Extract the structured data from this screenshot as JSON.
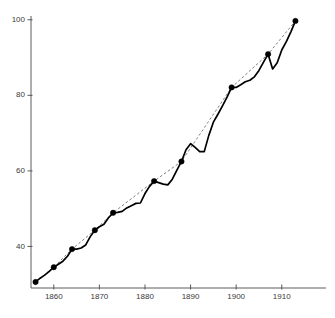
{
  "chart_data": {
    "type": "line",
    "title": "",
    "subtitle": "",
    "xlabel": "",
    "ylabel": "",
    "xlim": [
      1855,
      1914
    ],
    "ylim": [
      29,
      101
    ],
    "grid": false,
    "legend": "none",
    "x_ticks": [
      1860,
      1870,
      1880,
      1890,
      1900,
      1910
    ],
    "x_tick_labels": [
      "1860",
      "1870",
      "1880",
      "1890",
      "1900",
      "1910"
    ],
    "y_ticks": [
      40,
      60,
      80,
      100
    ],
    "y_tick_labels": [
      "40",
      "60",
      "80",
      "100"
    ],
    "series": [
      {
        "name": "annual series",
        "style": "solid",
        "color": "#000000",
        "x": [
          1856,
          1857,
          1858,
          1859,
          1860,
          1861,
          1862,
          1863,
          1864,
          1865,
          1866,
          1867,
          1868,
          1869,
          1870,
          1871,
          1872,
          1873,
          1874,
          1875,
          1876,
          1877,
          1878,
          1879,
          1880,
          1881,
          1882,
          1883,
          1884,
          1885,
          1886,
          1887,
          1888,
          1889,
          1890,
          1891,
          1892,
          1893,
          1894,
          1895,
          1896,
          1897,
          1898,
          1899,
          1900,
          1901,
          1902,
          1903,
          1904,
          1905,
          1906,
          1907,
          1908,
          1909,
          1910,
          1911,
          1912,
          1913
        ],
        "values": [
          30.6,
          31.6,
          32.4,
          33.4,
          34.5,
          35.3,
          36.1,
          37.4,
          39.3,
          39.3,
          39.6,
          40.4,
          42.6,
          44.3,
          45.2,
          45.9,
          47.6,
          48.9,
          49.0,
          49.3,
          50.2,
          50.8,
          51.4,
          51.5,
          54.0,
          55.9,
          57.3,
          56.9,
          56.5,
          56.3,
          57.8,
          60.2,
          62.5,
          65.6,
          67.2,
          66.2,
          65.1,
          65.1,
          69.4,
          72.9,
          75.0,
          77.2,
          79.5,
          82.1,
          82.1,
          82.8,
          83.6,
          84.0,
          84.9,
          86.6,
          88.8,
          90.9,
          87.0,
          88.6,
          92.0,
          94.2,
          96.8,
          99.7
        ]
      },
      {
        "name": "peak-to-peak trend",
        "style": "dashed",
        "color": "#5e5e5e",
        "x": [
          1856,
          1860,
          1864,
          1869,
          1873,
          1882,
          1888,
          1899,
          1907,
          1913
        ],
        "values": [
          30.6,
          34.5,
          39.3,
          44.3,
          48.9,
          57.3,
          62.5,
          82.1,
          90.9,
          99.7
        ]
      }
    ],
    "markers": {
      "name": "cycle peak markers",
      "shape": "filled-circle",
      "color": "#000000",
      "x": [
        1856,
        1860,
        1864,
        1869,
        1873,
        1882,
        1888,
        1899,
        1907,
        1913
      ],
      "values": [
        30.6,
        34.5,
        39.3,
        44.3,
        48.9,
        57.3,
        62.5,
        82.1,
        90.9,
        99.7
      ]
    },
    "geometry": {
      "plot_left": 31,
      "plot_right": 300,
      "plot_top": 16,
      "plot_bottom": 288,
      "x_pixel_per_year": 4.1,
      "y_pixel_per_unit": 3.4
    }
  }
}
